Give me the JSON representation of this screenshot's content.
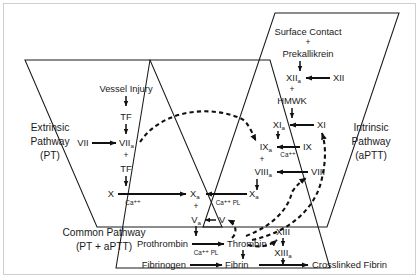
{
  "figure": {
    "background_color": "#ffffff",
    "line_color": "#111111",
    "text_color": "#1a1a1a",
    "border_color": "#cfcfcf"
  },
  "regions": {
    "extrinsic": {
      "name_line1": "Extrinsic",
      "name_line2": "Pathway",
      "name_line3": "(PT)"
    },
    "intrinsic": {
      "name_line1": "Intrinsic",
      "name_line2": "Pathway",
      "name_line3": "(aPTT)"
    },
    "common": {
      "name_line1": "Common Pathway",
      "name_line2": "(PT + aPTT)"
    }
  },
  "nodes": {
    "vessel_injury": "Vessel Injury",
    "tf_top": "TF",
    "tf_mid": "TF",
    "factor_vii": "VII",
    "factor_viia": "VII",
    "factor_viia_sub": "a",
    "surface_contact": "Surface Contact",
    "prekallikrein": "Prekallikrein",
    "factor_xii": "XII",
    "factor_xiia": "XII",
    "factor_xiia_sub": "a",
    "hmwk": "HMWK",
    "factor_xi": "XI",
    "factor_xia": "XI",
    "factor_xia_sub": "a",
    "factor_ix": "IX",
    "factor_ixa": "IX",
    "factor_ixa_sub": "a",
    "factor_viii": "VIII",
    "factor_viiia": "VIII",
    "factor_viiia_sub": "a",
    "factor_x_left": "X",
    "factor_xa_center": "X",
    "factor_xa_center_sub": "a",
    "factor_xa_right": "X",
    "factor_xa_right_sub": "a",
    "factor_v": "V",
    "factor_va": "V",
    "factor_va_sub": "a",
    "prothrombin": "Prothrombin",
    "thrombin": "Thrombin",
    "fibrinogen": "Fibrinogen",
    "fibrin": "Fibrin",
    "crosslinked_fibrin": "Crosslinked Fibrin",
    "factor_xiii": "XIII",
    "factor_xiiia": "XIII",
    "factor_xiiia_sub": "a"
  },
  "cofactors": {
    "plus_viia": "+",
    "plus_xiia": "+",
    "plus_ixa": "+",
    "plus_xa": "+",
    "plus_surface": "+",
    "ca_under_x": "Ca",
    "ca_under_x_sup": "++",
    "ca_under_ix": "Ca",
    "ca_under_ix_sup": "++",
    "ca_pl_under_xa": "Ca",
    "ca_pl_under_xa_sup": "++",
    "ca_pl_under_xa_pl": "PL",
    "ca_pl_under_prothrombin": "Ca",
    "ca_pl_under_prothrombin_sup": "++",
    "ca_pl_under_prothrombin_pl": "PL"
  }
}
